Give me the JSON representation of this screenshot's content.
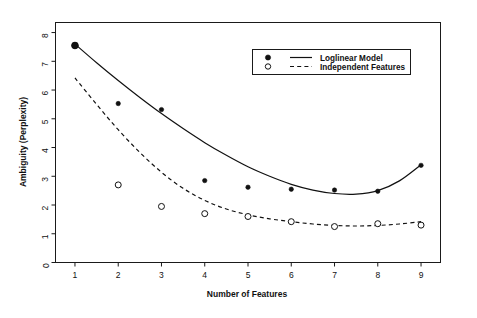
{
  "chart_data": {
    "type": "scatter",
    "title": "",
    "xlabel": "Number of Features",
    "ylabel": "Ambiguity (Perplexity)",
    "xlim": [
      0.55,
      9.45
    ],
    "ylim": [
      0,
      8.35
    ],
    "xticks": [
      1,
      2,
      3,
      4,
      5,
      6,
      7,
      8,
      9
    ],
    "yticks": [
      0,
      1,
      2,
      3,
      4,
      5,
      6,
      7,
      8
    ],
    "xticklabels": [
      "1",
      "2",
      "3",
      "4",
      "5",
      "6",
      "7",
      "8",
      "9"
    ],
    "yticklabels": [
      "0",
      "1",
      "2",
      "3",
      "4",
      "5",
      "6",
      "7",
      "8"
    ],
    "grid": false,
    "legend_position": "top-right",
    "x": [
      1,
      2,
      3,
      4,
      5,
      6,
      7,
      8,
      9
    ],
    "series": [
      {
        "name": "Loglinear Model",
        "marker": "filled-circle",
        "line_style": "solid",
        "color": "#111111",
        "values": [
          7.55,
          5.53,
          5.32,
          2.85,
          2.62,
          2.55,
          2.52,
          2.48,
          3.38
        ],
        "fit_curve": {
          "style": "solid",
          "x": [
            1.0,
            1.5,
            2.0,
            2.5,
            3.0,
            3.5,
            4.0,
            4.5,
            5.0,
            5.5,
            6.0,
            6.5,
            7.0,
            7.5,
            8.0,
            8.5,
            9.0
          ],
          "y": [
            7.6,
            6.95,
            6.33,
            5.74,
            5.18,
            4.66,
            4.17,
            3.73,
            3.33,
            3.0,
            2.72,
            2.52,
            2.4,
            2.38,
            2.5,
            2.84,
            3.4
          ]
        }
      },
      {
        "name": "Independent Features",
        "marker": "open-circle",
        "line_style": "dashed",
        "color": "#111111",
        "values": [
          7.55,
          2.7,
          1.95,
          1.7,
          1.6,
          1.42,
          1.25,
          1.35,
          1.3
        ],
        "fit_curve": {
          "style": "dashed",
          "x": [
            1.0,
            1.5,
            2.0,
            2.5,
            3.0,
            3.5,
            4.0,
            4.5,
            5.0,
            5.5,
            6.0,
            6.5,
            7.0,
            7.5,
            8.0,
            8.5,
            9.0
          ],
          "y": [
            6.42,
            5.5,
            4.62,
            3.83,
            3.14,
            2.58,
            2.16,
            1.86,
            1.66,
            1.52,
            1.42,
            1.34,
            1.29,
            1.27,
            1.29,
            1.34,
            1.42
          ]
        }
      }
    ],
    "legend": [
      {
        "label": "Loglinear Model",
        "marker": "filled-circle",
        "line_style": "solid"
      },
      {
        "label": "Independent Features",
        "marker": "open-circle",
        "line_style": "dashed"
      }
    ]
  }
}
